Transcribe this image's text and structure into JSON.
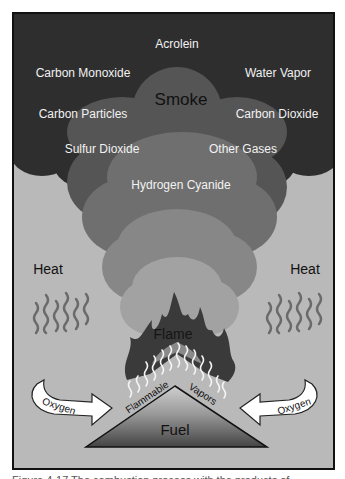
{
  "diagram": {
    "type": "fire-process",
    "colors": {
      "background": "#b9b9b9",
      "smoke_dark": "#2e2e2e",
      "smoke_mid1": "#5a5a5a",
      "smoke_mid2": "#757575",
      "smoke_mid3": "#8e8e8e",
      "smoke_light": "#a6a6a6",
      "flame": "#3a3a3a",
      "heat_lines": "#6a6a6a",
      "arrow_fill": "#ffffff",
      "fuel_top": "#c8c8c8",
      "fuel_bottom": "#4a4a4a"
    },
    "smoke": {
      "title": "Smoke",
      "components": [
        "Acrolein",
        "Carbon Monoxide",
        "Water Vapor",
        "Carbon Particles",
        "Carbon Dioxide",
        "Sulfur Dioxide",
        "Other Gases",
        "Hydrogen Cyanide"
      ]
    },
    "heat_left": "Heat",
    "heat_right": "Heat",
    "flame": "Flame",
    "vapors_left": "Flammable",
    "vapors_right": "Vapors",
    "oxygen_left": "Oxygen",
    "oxygen_right": "Oxygen",
    "fuel": "Fuel"
  },
  "caption": "Figure 4-17 The combustion process with the products of combustion."
}
